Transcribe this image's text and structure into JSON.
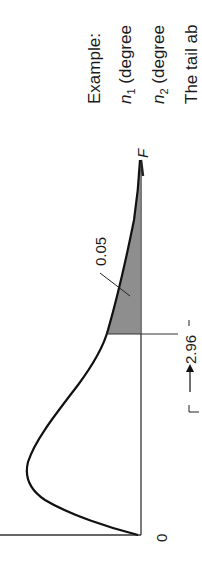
{
  "figure": {
    "axis_label_f": "F",
    "origin_label": "0",
    "critical_value": "2.96",
    "tail_area_label": "0.05",
    "colors": {
      "line": "#1a1a1a",
      "shade": "#7a7a7a",
      "background": "#ffffff"
    }
  },
  "caption": {
    "line1": "Example:",
    "line2_var": "n",
    "line2_sub": "1",
    "line2_text": " (degree",
    "line3_var": "n",
    "line3_sub": "2",
    "line3_text": " (degree",
    "line4": "The tail ab"
  }
}
